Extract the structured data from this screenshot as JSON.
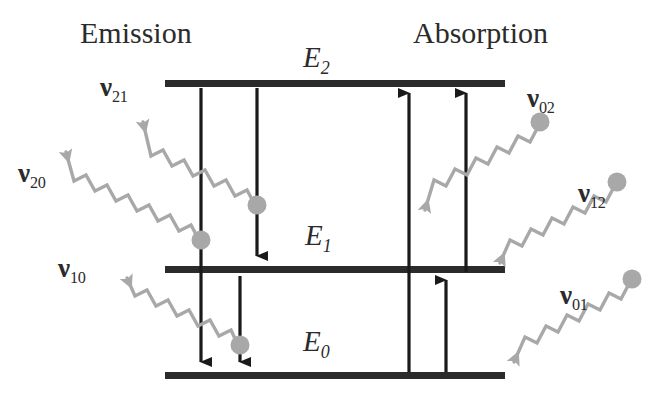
{
  "figure": {
    "type": "energy-level-diagram",
    "title_left": "Emission",
    "title_right": "Absorption",
    "colors": {
      "level_line": "#2b2b2b",
      "transition_arrow": "#1a1a1a",
      "photon_wave": "#a8a8a8",
      "photon_dot": "#a8a8a8",
      "text": "#2b2b2b",
      "background": "#ffffff"
    }
  },
  "levels": [
    {
      "id": "E2",
      "label": "E",
      "sub": "2",
      "y": 84,
      "x1": 165,
      "x2": 505
    },
    {
      "id": "E1",
      "label": "E",
      "sub": "1",
      "y": 270,
      "x1": 165,
      "x2": 505
    },
    {
      "id": "E0",
      "label": "E",
      "sub": "0",
      "y": 376,
      "x1": 165,
      "x2": 505
    }
  ],
  "transitions": [
    {
      "id": "t_2_0",
      "side": "emission",
      "from": "E2",
      "to": "E0",
      "direction": "down",
      "x": 201
    },
    {
      "id": "t_2_1",
      "side": "emission",
      "from": "E2",
      "to": "E1",
      "direction": "down",
      "x": 257
    },
    {
      "id": "t_1_0",
      "side": "emission",
      "from": "E1",
      "to": "E0",
      "direction": "down",
      "x": 240
    },
    {
      "id": "t_0_2",
      "side": "absorption",
      "from": "E0",
      "to": "E2",
      "direction": "up",
      "x": 409
    },
    {
      "id": "t_1_2",
      "side": "absorption",
      "from": "E1",
      "to": "E2",
      "direction": "up",
      "x": 466
    },
    {
      "id": "t_0_1",
      "side": "absorption",
      "from": "E0",
      "to": "E1",
      "direction": "up",
      "x": 446
    }
  ],
  "photons": [
    {
      "id": "nu21",
      "label": "ν",
      "sub": "21",
      "side": "emission",
      "label_x": 100,
      "label_y": 72
    },
    {
      "id": "nu20",
      "label": "ν",
      "sub": "20",
      "side": "emission",
      "label_x": 18,
      "label_y": 158
    },
    {
      "id": "nu10",
      "label": "ν",
      "sub": "10",
      "side": "emission",
      "label_x": 58,
      "label_y": 253
    },
    {
      "id": "nu02",
      "label": "ν",
      "sub": "02",
      "side": "absorption",
      "label_x": 527,
      "label_y": 83
    },
    {
      "id": "nu12",
      "label": "ν",
      "sub": "12",
      "side": "absorption",
      "label_x": 578,
      "label_y": 178
    },
    {
      "id": "nu01",
      "label": "ν",
      "sub": "01",
      "side": "absorption",
      "label_x": 560,
      "label_y": 280
    }
  ],
  "headers": [
    {
      "id": "emission-title",
      "text": "Emission",
      "x": 80,
      "y": 16
    },
    {
      "id": "absorption-title",
      "text": "Absorption",
      "x": 413,
      "y": 16
    }
  ]
}
